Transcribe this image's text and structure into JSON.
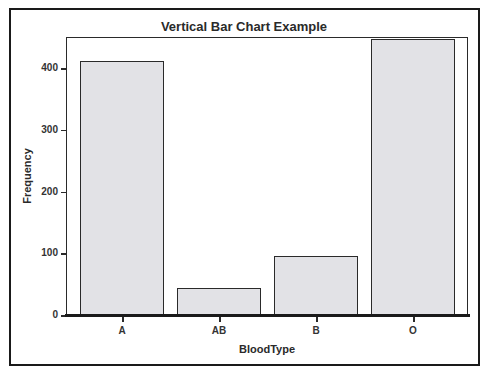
{
  "chart_data": {
    "type": "bar",
    "title": "Vertical Bar Chart Example",
    "xlabel": "BloodType",
    "ylabel": "Frequency",
    "categories": [
      "A",
      "AB",
      "B",
      "O"
    ],
    "values": [
      411,
      44,
      96,
      447
    ],
    "ylim": [
      0,
      450
    ],
    "yticks": [
      0,
      100,
      200,
      300,
      400
    ],
    "grid": false,
    "legend": null,
    "bar_color": "#e2e2e6",
    "edge_color": "#2a2a2a"
  },
  "labels": {
    "title": "Vertical Bar Chart Example",
    "xlabel": "BloodType",
    "ylabel": "Frequency",
    "yticks": [
      "0",
      "100",
      "200",
      "300",
      "400"
    ],
    "xticks": [
      "A",
      "AB",
      "B",
      "O"
    ]
  }
}
